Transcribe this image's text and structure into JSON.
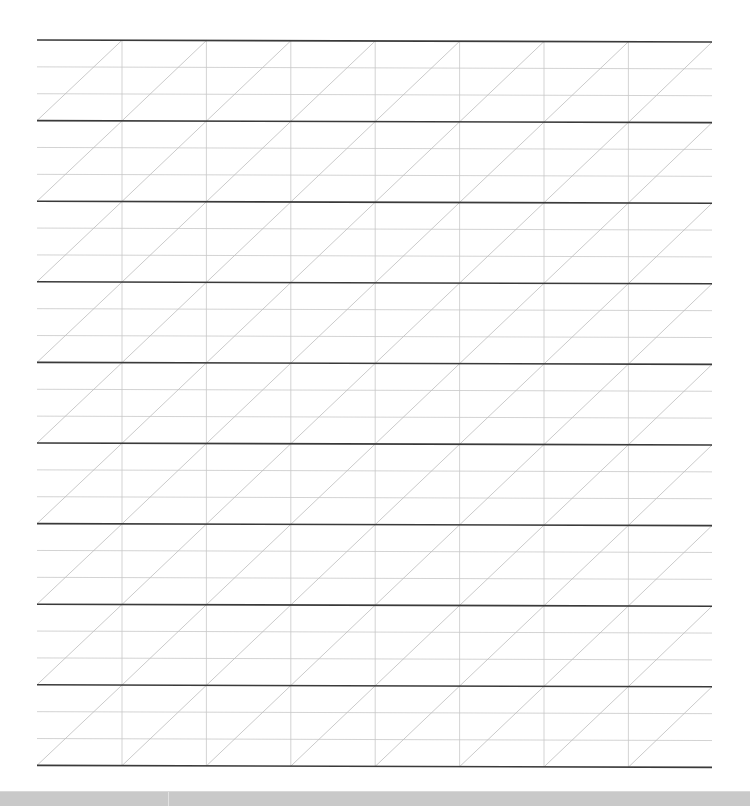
{
  "sheet": {
    "type": "handwriting-practice-grid",
    "bands": 9,
    "columns": 8,
    "guide_lines_per_band": 2,
    "left": 37,
    "right": 712,
    "top": 40,
    "band_height": 80.6,
    "column_width": 84.4,
    "first_vertical_x": 122,
    "right_slope_px": 2,
    "colors": {
      "background": "#ffffff",
      "baseline": "#3a3a3a",
      "guide": "#c8c8c8",
      "vertical": "#c8c8c8",
      "diagonal": "#bdbdbd",
      "bottom_bar": "#c9c9c9"
    }
  },
  "bottom_bar": {
    "segments": 2
  }
}
